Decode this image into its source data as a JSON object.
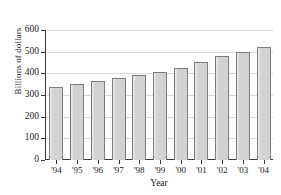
{
  "chart_data": {
    "type": "bar",
    "title": "",
    "xlabel": "Year",
    "ylabel": "Billions of dollars",
    "categories": [
      "'94",
      "'95",
      "'96",
      "'97",
      "'98",
      "'99",
      "'00",
      "'01",
      "'02",
      "'03",
      "'04"
    ],
    "values": [
      337,
      350,
      365,
      380,
      392,
      405,
      425,
      452,
      478,
      497,
      521
    ],
    "ylim": [
      0,
      600
    ],
    "yticks": [
      0,
      100,
      200,
      300,
      400,
      500,
      600
    ],
    "ytick_labels": [
      "0",
      "100",
      "200",
      "300",
      "400",
      "500",
      "600"
    ],
    "grid": true,
    "legend": false,
    "colors": {
      "bar_fill": "#d2d2d2",
      "bar_border": "#7c7c7c",
      "axis": "#3a3a3a",
      "gridline": "#d9d9d9",
      "background": "#ffffff",
      "text": "#1a1a1a"
    }
  }
}
